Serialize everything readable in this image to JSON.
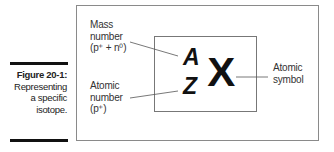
{
  "caption": {
    "title": "Figure 20-1:",
    "lines": [
      "Representing",
      "a specific",
      "isotope."
    ]
  },
  "labels": {
    "mass": [
      "Mass",
      "number",
      "(p⁺ + n⁰)"
    ],
    "atomic": [
      "Atomic",
      "number",
      "(p⁺)"
    ],
    "symbol": [
      "Atomic",
      "symbol"
    ]
  },
  "notation": {
    "mass_number": "A",
    "atomic_number": "Z",
    "symbol": "X"
  }
}
